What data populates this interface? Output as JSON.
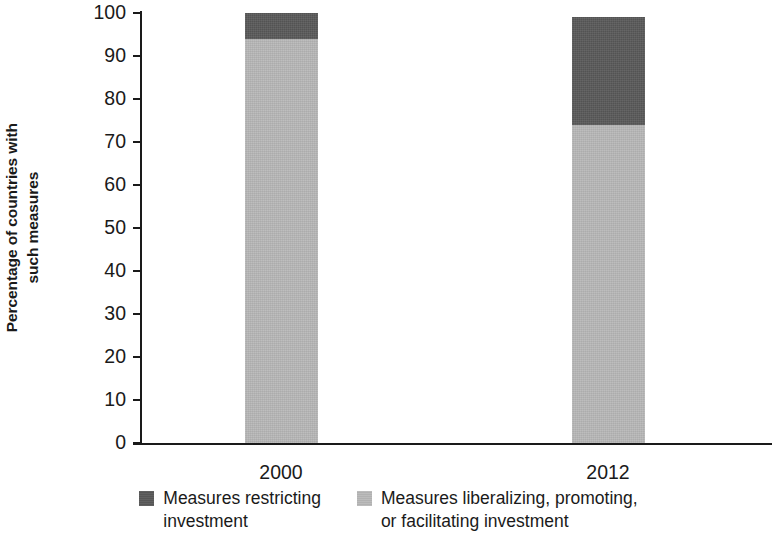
{
  "chart_data": {
    "type": "bar",
    "subtype": "stacked-bar",
    "title": "",
    "xlabel": "",
    "ylabel": "Percentage of countries with\nsuch measures",
    "ylabel_lines": [
      "Percentage of countries with",
      "such measures"
    ],
    "categories": [
      "2000",
      "2012"
    ],
    "ylim": [
      0,
      100
    ],
    "yticks": [
      0,
      10,
      20,
      30,
      40,
      50,
      60,
      70,
      80,
      90,
      100
    ],
    "ytick_labels": [
      "0",
      "10",
      "20",
      "30",
      "40",
      "50",
      "60",
      "70",
      "80",
      "90",
      "100"
    ],
    "grid": false,
    "legend_position": "bottom",
    "series": [
      {
        "name": "Measures liberalizing, promoting, or facilitating investment",
        "name_lines": [
          "Measures liberalizing, promoting,",
          "or facilitating investment"
        ],
        "color": "#b8b8b8",
        "values": [
          94,
          74
        ]
      },
      {
        "name": "Measures restricting investment",
        "name_lines": [
          "Measures restricting",
          "investment"
        ],
        "color": "#595959",
        "values": [
          6,
          25
        ]
      }
    ],
    "totals": [
      100,
      99
    ]
  },
  "axis": {
    "y_title_line1": "Percentage of countries with",
    "y_title_line2": "such measures",
    "ytick_0": "0",
    "ytick_10": "10",
    "ytick_20": "20",
    "ytick_30": "30",
    "ytick_40": "40",
    "ytick_50": "50",
    "ytick_60": "60",
    "ytick_70": "70",
    "ytick_80": "80",
    "ytick_90": "90",
    "ytick_100": "100",
    "xtick_1": "2000",
    "xtick_2": "2012"
  },
  "legend": {
    "item1_line1": "Measures restricting",
    "item1_line2": "investment",
    "item1_color": "#595959",
    "item2_line1": "Measures liberalizing, promoting,",
    "item2_line2": "or facilitating investment",
    "item2_color": "#b8b8b8"
  },
  "colors": {
    "restricting": "#595959",
    "liberalizing": "#b8b8b8",
    "axis": "#1a1a1a",
    "background": "#ffffff"
  }
}
